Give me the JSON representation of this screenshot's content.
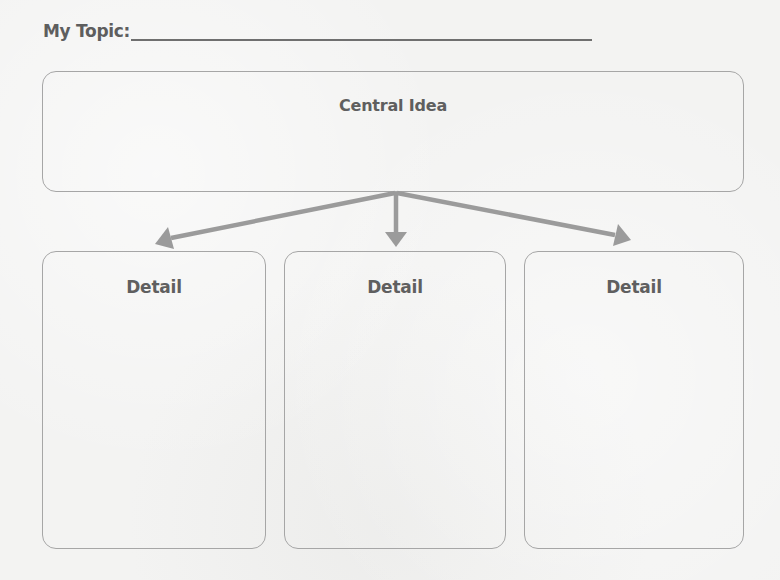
{
  "worksheet": {
    "topic": {
      "label": "My Topic:",
      "value": ""
    },
    "central": {
      "title": "Central Idea",
      "value": ""
    },
    "details": [
      {
        "title": "Detail",
        "value": ""
      },
      {
        "title": "Detail",
        "value": ""
      },
      {
        "title": "Detail",
        "value": ""
      }
    ]
  },
  "colors": {
    "text": "#5f5f5f",
    "box_border": "#a6a6a6",
    "arrow": "#9b9b9b",
    "topic_line": "#6f6f6f",
    "paper": "#f3f3f2"
  },
  "arrows": [
    {
      "name": "arrow-to-detail-1",
      "from": [
        395,
        192
      ],
      "to": [
        155,
        244
      ]
    },
    {
      "name": "arrow-to-detail-2",
      "from": [
        395,
        192
      ],
      "to": [
        395,
        247
      ]
    },
    {
      "name": "arrow-to-detail-3",
      "from": [
        395,
        192
      ],
      "to": [
        631,
        240
      ]
    }
  ]
}
